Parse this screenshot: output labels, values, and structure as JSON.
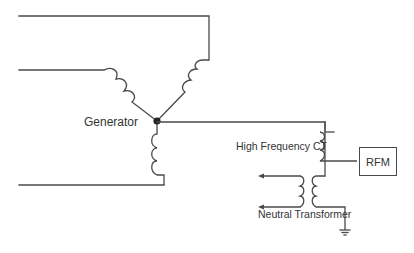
{
  "diagram": {
    "type": "electrical-schematic",
    "labels": {
      "generator": "Generator",
      "ct": "High Frequency CT",
      "rfm": "RFM",
      "neutral_transformer": "Neutral Transformer"
    },
    "components": [
      {
        "id": "generator",
        "kind": "wye-connected windings (3 coils)"
      },
      {
        "id": "neutral-point",
        "kind": "junction dot"
      },
      {
        "id": "ct",
        "kind": "high-frequency current transformer"
      },
      {
        "id": "rfm",
        "kind": "monitor box"
      },
      {
        "id": "neutral-transformer",
        "kind": "transformer (primary + secondary)"
      },
      {
        "id": "ground",
        "kind": "ground symbol"
      }
    ],
    "connections": [
      [
        "generator",
        "neutral-point"
      ],
      [
        "neutral-point",
        "ct"
      ],
      [
        "ct",
        "rfm"
      ],
      [
        "ct",
        "neutral-transformer"
      ],
      [
        "neutral-transformer",
        "ground"
      ]
    ],
    "colors": {
      "line": "#4a4a4a",
      "text": "#333333",
      "background": "#ffffff"
    }
  }
}
